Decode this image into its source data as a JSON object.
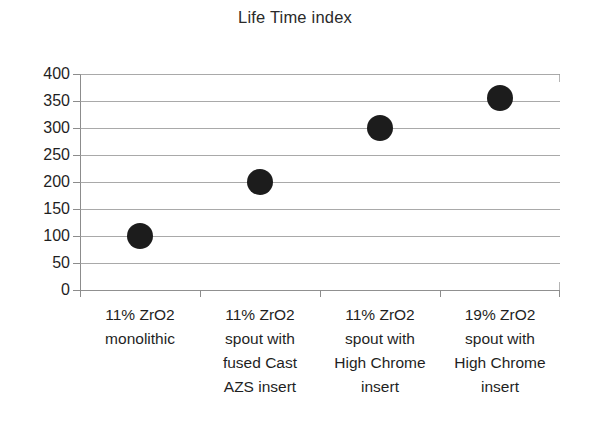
{
  "chart_data": {
    "type": "scatter",
    "title": "Life Time index",
    "xlabel": "",
    "ylabel": "",
    "categories": [
      "11% ZrO2\nmonolithic",
      "11% ZrO2\nspout with\nfused Cast\nAZS insert",
      "11% ZrO2\nspout with\nHigh Chrome\ninsert",
      "19% ZrO2\nspout with\nHigh Chrome\ninsert"
    ],
    "values": [
      100,
      200,
      300,
      355
    ],
    "ylim": [
      0,
      400
    ],
    "y_ticks": [
      0,
      50,
      100,
      150,
      200,
      250,
      300,
      350,
      400
    ],
    "y_tick_labels": [
      "0",
      "50",
      "100",
      "150",
      "200",
      "250",
      "300",
      "350",
      "400"
    ],
    "grid": "horizontal",
    "legend": "none",
    "marker_color": "#1c1c1c",
    "gridline_color": "#9a9a9a",
    "axis_color": "#8c8c8c",
    "background_color": "#ffffff"
  }
}
